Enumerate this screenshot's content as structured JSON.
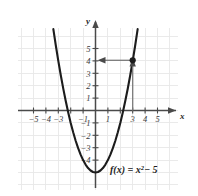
{
  "figure": {
    "title": "",
    "formula": "f(x) = x",
    "formula_exponent": "2",
    "formula_tail": "− 5",
    "formula_full": "f(x) = x² − 5"
  },
  "axes": {
    "x_name": "x",
    "y_name": "y",
    "x_ticks": [
      "−5",
      "−4",
      "−3",
      "−1",
      "1",
      "3",
      "4",
      "5"
    ],
    "x_tick_values": [
      -5,
      -4,
      -3,
      -1,
      1,
      3,
      4,
      5
    ],
    "y_ticks": [
      "5",
      "4",
      "3",
      "2",
      "1",
      "−1",
      "−2",
      "−3",
      "−4"
    ],
    "y_tick_values": [
      5,
      4,
      3,
      2,
      1,
      -1,
      -2,
      -3,
      -4
    ]
  },
  "colors": {
    "grid": "#e6e6e6",
    "axis": "#4a4a4a",
    "curve": "#1c1c1c",
    "annotation": "#6b6b6b",
    "text": "#2a2a2a",
    "background": "#ffffff"
  },
  "chart_data": {
    "type": "line",
    "title": "",
    "xlabel": "x",
    "ylabel": "y",
    "xlim": [
      -5.9,
      6.2
    ],
    "ylim": [
      -6.4,
      6.4
    ],
    "grid": true,
    "legend": null,
    "function": "f(x) = x^2 - 5",
    "series": [
      {
        "name": "f(x) = x² − 5",
        "x": [
          -3.4,
          -3.2,
          -3.0,
          -2.8,
          -2.6,
          -2.4,
          -2.2,
          -2.0,
          -1.8,
          -1.6,
          -1.4,
          -1.2,
          -1.0,
          -0.8,
          -0.6,
          -0.4,
          -0.2,
          0.0,
          0.2,
          0.4,
          0.6,
          0.8,
          1.0,
          1.2,
          1.4,
          1.6,
          1.8,
          2.0,
          2.2,
          2.4,
          2.6,
          2.8,
          3.0,
          3.2,
          3.4
        ],
        "y": [
          6.56,
          5.24,
          4.0,
          2.84,
          1.76,
          0.76,
          -0.16,
          -1.0,
          -1.76,
          -2.44,
          -3.04,
          -3.56,
          -4.0,
          -4.36,
          -4.64,
          -4.84,
          -4.96,
          -5.0,
          -4.96,
          -4.84,
          -4.64,
          -4.36,
          -4.0,
          -3.56,
          -3.04,
          -2.44,
          -1.76,
          -1.0,
          -0.16,
          0.76,
          1.76,
          2.84,
          4.0,
          5.24,
          6.56
        ]
      }
    ],
    "points": [
      {
        "label": "(3, 4)",
        "x": 3,
        "y": 4
      }
    ],
    "annotations": [
      {
        "type": "arrow",
        "name": "vertical-trace",
        "from": [
          3,
          0
        ],
        "to": [
          3,
          4
        ]
      },
      {
        "type": "arrow",
        "name": "horizontal-trace",
        "from": [
          3,
          4
        ],
        "to": [
          0,
          4
        ]
      }
    ],
    "vertex": [
      0,
      -5
    ],
    "roots": [
      -2.236,
      2.236
    ]
  }
}
